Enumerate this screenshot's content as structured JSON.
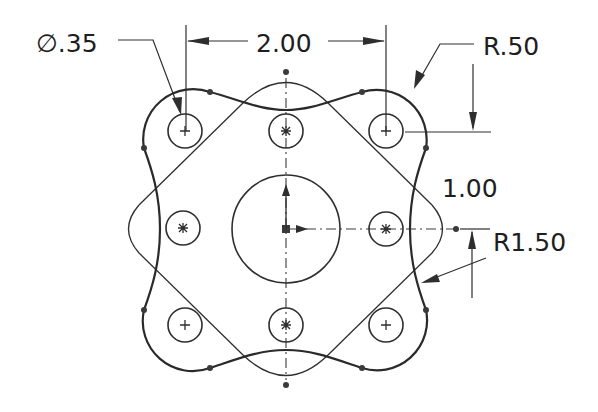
{
  "drawing": {
    "title": "Sketch with dimensions",
    "units_scale_px_per_inch": 100,
    "dimensions": {
      "hole_diameter": {
        "label": "∅.35",
        "type": "diameter"
      },
      "horizontal_spacing": {
        "label": "2.00",
        "type": "linear-horizontal"
      },
      "corner_radius": {
        "label": "R.50",
        "type": "radius"
      },
      "vertical_spacing": {
        "label": "1.00",
        "type": "linear-vertical"
      },
      "side_radius": {
        "label": "R1.50",
        "type": "radius"
      }
    },
    "features": {
      "center_circle": {
        "cx": 286,
        "cy": 229,
        "r": 54
      },
      "corner_holes": [
        {
          "cx": 185,
          "cy": 131,
          "r": 17,
          "mark": "+"
        },
        {
          "cx": 386,
          "cy": 131,
          "r": 17,
          "mark": "+"
        },
        {
          "cx": 185,
          "cy": 329,
          "r": 17,
          "mark": "+"
        },
        {
          "cx": 386,
          "cy": 329,
          "r": 17,
          "mark": "+"
        }
      ],
      "mid_holes": [
        {
          "cx": 286,
          "cy": 131,
          "r": 17,
          "mark": "*"
        },
        {
          "cx": 183,
          "cy": 229,
          "r": 17,
          "mark": "*"
        },
        {
          "cx": 386,
          "cy": 229,
          "r": 17,
          "mark": "*"
        },
        {
          "cx": 286,
          "cy": 329,
          "r": 17,
          "mark": "*"
        }
      ]
    },
    "colors": {
      "line": "#2a2a2a",
      "background": "#ffffff"
    }
  }
}
